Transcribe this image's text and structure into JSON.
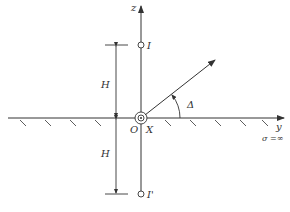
{
  "diagram": {
    "axes": {
      "z_label": "z",
      "y_label": "y"
    },
    "origin_label": "O",
    "source_label": "X",
    "image_points": {
      "upper": "I",
      "lower": "I'"
    },
    "distances": {
      "upper": "H",
      "lower": "H"
    },
    "angle_label": "Δ",
    "medium_label": "σ =∞",
    "colors": {
      "line": "#333333",
      "background": "#ffffff"
    }
  }
}
